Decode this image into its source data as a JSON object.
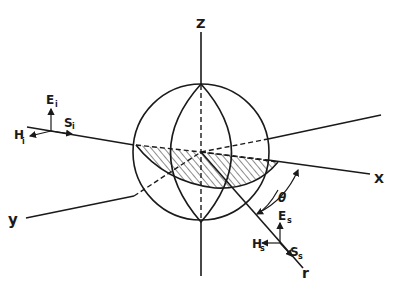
{
  "figure": {
    "type": "scattering geometry diagram",
    "axes": {
      "z_label": "Z",
      "x_label": "X",
      "y_label": "y",
      "r_label": "r"
    },
    "angle_label": "θ",
    "incident": {
      "E": "E",
      "E_sub": "i",
      "H": "H",
      "H_sub": "i",
      "S": "S",
      "S_sub": "i"
    },
    "scattered": {
      "E": "E",
      "E_sub": "s",
      "H": "H",
      "H_sub": "s",
      "S": "S",
      "S_sub": "s"
    },
    "colors": {
      "ink": "#1a1a1a",
      "background": "#ffffff"
    }
  }
}
